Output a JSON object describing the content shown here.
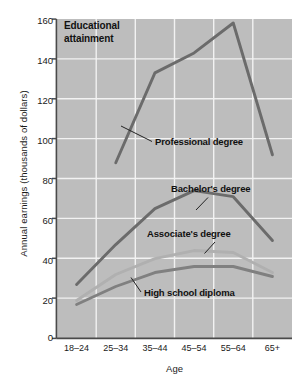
{
  "chart_data": {
    "type": "line",
    "title": "Educational attainment",
    "xlabel": "Age",
    "ylabel": "Annual earnings (thousands of dollars)",
    "categories": [
      "18–24",
      "25–34",
      "35–44",
      "45–54",
      "55–64",
      "65+"
    ],
    "ylim": [
      0,
      160
    ],
    "yticks": [
      0,
      20,
      40,
      60,
      80,
      100,
      120,
      140,
      160
    ],
    "grid": true,
    "legend": "inline annotations",
    "series": [
      {
        "name": "Professional degree",
        "color": "#6b6b6b",
        "values": [
          null,
          88,
          133,
          143,
          158,
          92
        ]
      },
      {
        "name": "Bachelor's degree",
        "color": "#6b6b6b",
        "values": [
          27,
          47,
          65,
          74,
          71,
          49
        ]
      },
      {
        "name": "Associate's degree",
        "color": "#b0b0b0",
        "values": [
          19,
          32,
          40,
          44,
          43,
          33
        ]
      },
      {
        "name": "High school diploma",
        "color": "#808080",
        "values": [
          17,
          26,
          33,
          36,
          36,
          31
        ]
      }
    ],
    "plot_background": "#bdbdbd",
    "gridline_color": "#f0f0f0",
    "annotations": [
      {
        "text": "Professional degree",
        "series": "Professional degree"
      },
      {
        "text": "Bachelor's degree",
        "series": "Bachelor's degree"
      },
      {
        "text": "Associate's degree",
        "series": "Associate's degree"
      },
      {
        "text": "High school diploma",
        "series": "High school diploma"
      }
    ]
  },
  "axis": {
    "y_tick_labels": [
      "160",
      "140",
      "120",
      "100",
      "80",
      "60",
      "40",
      "20",
      "0"
    ],
    "x_tick_labels": [
      "18–24",
      "25–34",
      "35–44",
      "45–54",
      "55–64",
      "65+"
    ],
    "y_axis_title": "Annual earnings (thousands of dollars)",
    "x_axis_title": "Age"
  },
  "labels": {
    "title_line1": "Educational",
    "title_line2": "attainment",
    "professional": "Professional degree",
    "bachelors": "Bachelor's degree",
    "associates": "Associate's degree",
    "highschool": "High school diploma"
  }
}
